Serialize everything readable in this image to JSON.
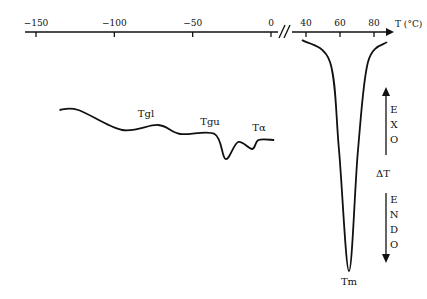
{
  "chart_data": {
    "type": "line",
    "title": "",
    "xlabel": "T (°C)",
    "ylabel": "ΔT",
    "x_ticks_low": [
      "-150",
      "-100",
      "-50",
      "0"
    ],
    "x_ticks_high": [
      "40",
      "60",
      "80"
    ],
    "axis_break": "//",
    "annotations": [
      "Tgl",
      "Tgu",
      "Tα",
      "Tm"
    ],
    "exo_label": [
      "E",
      "X",
      "O"
    ],
    "endo_label": [
      "E",
      "N",
      "D",
      "O"
    ],
    "delta_label": "ΔT",
    "series": [
      {
        "name": "low-temperature transitions",
        "x": [
          -135,
          -123,
          -95,
          -72,
          -58,
          -36,
          -29,
          -21,
          -12,
          -8,
          2
        ],
        "y": [
          0,
          0,
          -20,
          -15,
          -24,
          -24,
          -49,
          -32,
          -39,
          -30,
          -30
        ]
      },
      {
        "name": "melting peak",
        "x": [
          37,
          50,
          57,
          63,
          70,
          77,
          86
        ],
        "y": [
          0,
          -25,
          -120,
          -231,
          -120,
          -20,
          0
        ]
      }
    ]
  }
}
